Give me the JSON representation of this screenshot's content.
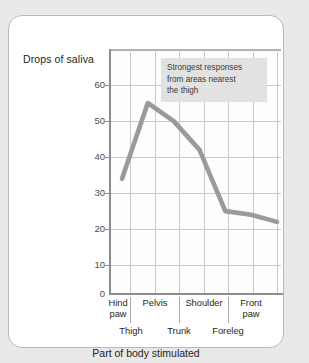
{
  "chart_data": {
    "type": "line",
    "title": "",
    "xlabel": "Part of body stimulated",
    "ylabel": "Drops of saliva",
    "ylim": [
      0,
      68
    ],
    "yticks": [
      0,
      10,
      20,
      30,
      40,
      50,
      60
    ],
    "ytick_labels": [
      "0",
      "10",
      "20",
      "30",
      "40",
      "50",
      "60"
    ],
    "grid": true,
    "legend": "none",
    "categories": [
      "Hind paw",
      "Thigh",
      "Pelvis",
      "Trunk",
      "Shoulder",
      "Foreleg",
      "Front paw"
    ],
    "values": [
      32,
      53,
      48,
      40,
      23,
      22,
      20
    ],
    "x_row_primary": [
      "Hind paw",
      "Pelvis",
      "Shoulder",
      "Front paw"
    ],
    "x_row_secondary": [
      "Thigh",
      "Trunk",
      "Foreleg"
    ],
    "line_color": "#9a9a9a",
    "annotations": [
      {
        "text": "Strongest responses from areas nearest the thigh",
        "background": "#e2e2e2"
      }
    ]
  },
  "axes": {
    "y_title": "Drops of saliva",
    "x_title": "Part of body stimulated",
    "y_tick_0": "0",
    "y_tick_10": "10",
    "y_tick_20": "20",
    "y_tick_30": "30",
    "y_tick_40": "40",
    "y_tick_50": "50",
    "y_tick_60": "60"
  },
  "xlabels": {
    "hind_paw_line1": "Hind",
    "hind_paw_line2": "paw",
    "pelvis": "Pelvis",
    "shoulder": "Shoulder",
    "front_paw_line1": "Front",
    "front_paw_line2": "paw",
    "thigh": "Thigh",
    "trunk": "Trunk",
    "foreleg": "Foreleg"
  },
  "annotation": {
    "line1": "Strongest responses",
    "line2": "from areas nearest",
    "line3": "the thigh"
  }
}
